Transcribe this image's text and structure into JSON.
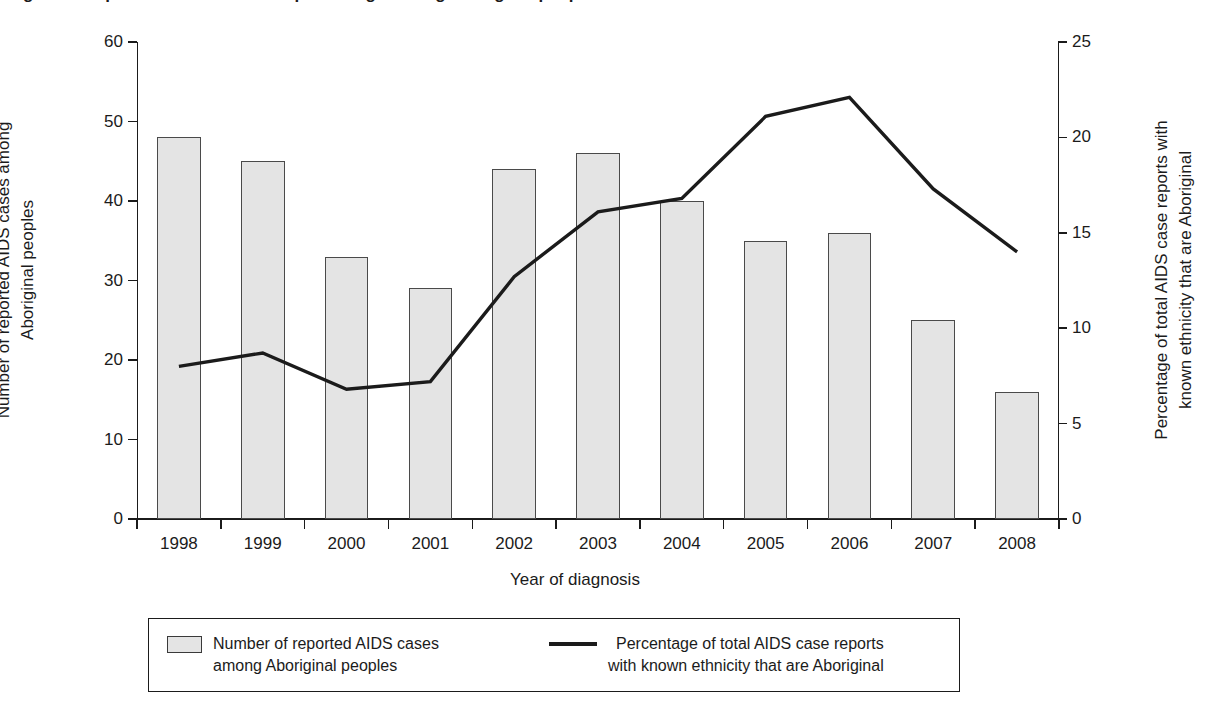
{
  "figure": {
    "title_clipped": "Figure 1. Reported AIDS cases and percentage among Aboriginal peoples",
    "x_axis_title": "Year of diagnosis",
    "y_left_title": "Number of reported AIDS cases among\nAboriginal peoples",
    "y_right_title": "Percentage of total AIDS case reports with\nknown ethnicity that are Aboriginal"
  },
  "legend": {
    "position": "bottom",
    "items": [
      {
        "marker": "bar-swatch",
        "label": "Number of reported AIDS cases\namong Aboriginal peoples"
      },
      {
        "marker": "line-swatch",
        "label": "Percentage of total AIDS case reports\nwith known ethnicity that are Aboriginal"
      }
    ]
  },
  "colors": {
    "bar_fill": "#e4e4e4",
    "bar_stroke": "#4a4a4a",
    "line": "#1b1b1b",
    "axis": "#1b1b1b",
    "background": "#ffffff"
  },
  "chart_data": {
    "type": "bar",
    "xlabel": "Year of diagnosis",
    "ylabel": "Number of reported AIDS cases among Aboriginal peoples",
    "y2label": "Percentage of total AIDS case reports with known ethnicity that are Aboriginal",
    "categories": [
      "1998",
      "1999",
      "2000",
      "2001",
      "2002",
      "2003",
      "2004",
      "2005",
      "2006",
      "2007",
      "2008"
    ],
    "ylim": [
      0,
      60
    ],
    "yticks": [
      0,
      10,
      20,
      30,
      40,
      50,
      60
    ],
    "y2lim": [
      0,
      25
    ],
    "y2ticks": [
      0,
      5,
      10,
      15,
      20,
      25
    ],
    "grid": false,
    "series": [
      {
        "name": "Number of reported AIDS cases among Aboriginal peoples",
        "type": "bar",
        "axis": "left",
        "values": [
          48,
          45,
          33,
          29,
          44,
          46,
          40,
          35,
          36,
          25,
          16
        ]
      },
      {
        "name": "Percentage of total AIDS case reports with known ethnicity that are Aboriginal",
        "type": "line",
        "axis": "right",
        "values": [
          8.0,
          8.7,
          6.8,
          7.2,
          12.7,
          16.1,
          16.8,
          21.1,
          22.1,
          17.3,
          14.0
        ]
      }
    ]
  }
}
